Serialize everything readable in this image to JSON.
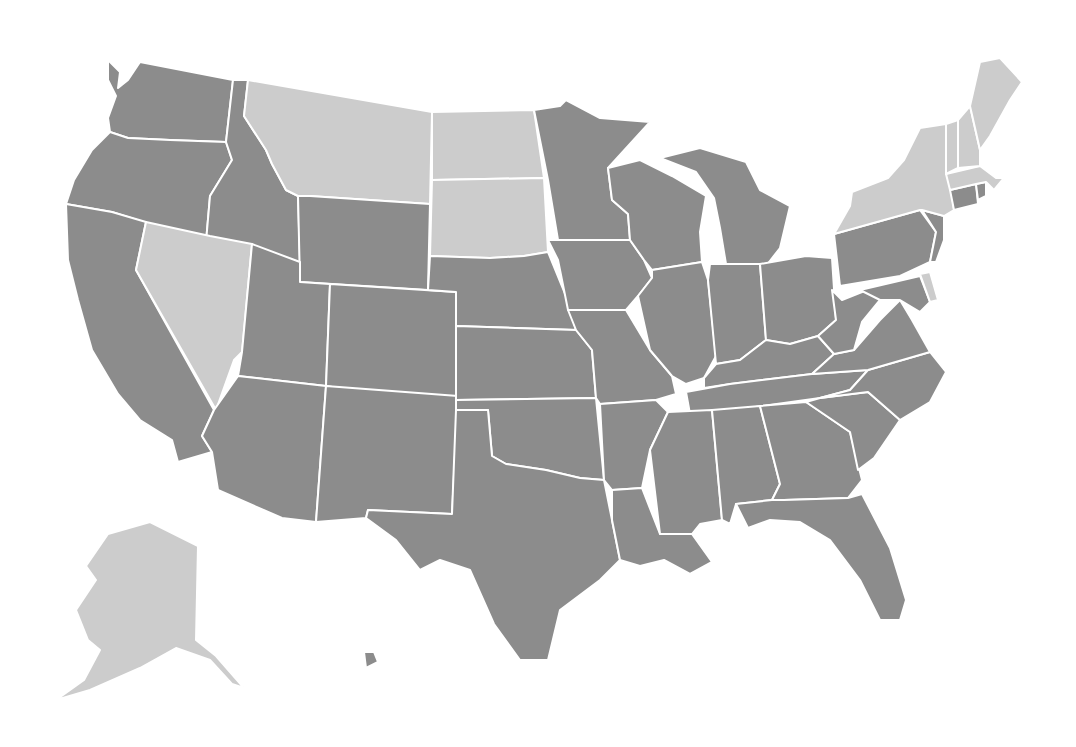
{
  "map": {
    "title": "",
    "type": "choropleth",
    "categories": [
      {
        "id": "dark",
        "color": "#8c8c8c"
      },
      {
        "id": "light",
        "color": "#cccccc"
      }
    ],
    "border_color": "#ffffff",
    "background": "#ffffff",
    "states": [
      {
        "abbr": "WA",
        "category": "dark",
        "points": "108,60 120,72 118,88 128,80 140,62 233,80 226,142 170,140 128,138 110,132 108,118 116,96 108,80"
      },
      {
        "abbr": "OR",
        "category": "dark",
        "points": "110,132 128,138 170,140 226,142 232,160 210,196 206,242 112,212 66,204 74,180 92,150"
      },
      {
        "abbr": "CA",
        "category": "dark",
        "points": "66,204 112,212 146,222 136,270 214,410 202,436 212,452 178,462 172,440 140,420 118,394 92,350 78,300 68,260"
      },
      {
        "abbr": "ID",
        "category": "dark",
        "points": "233,80 248,80 244,116 266,150 272,164 286,190 298,196 300,262 262,260 210,250 206,242 210,196 232,160 226,142"
      },
      {
        "abbr": "NV",
        "category": "light",
        "points": "146,222 210,236 252,244 242,352 234,360 216,410 136,270"
      },
      {
        "abbr": "MT",
        "category": "light",
        "points": "248,80 432,112 430,204 310,196 298,196 286,190 272,164 266,150 244,116"
      },
      {
        "abbr": "WY",
        "category": "dark",
        "points": "310,196 430,204 428,290 300,282 298,196"
      },
      {
        "abbr": "UT",
        "category": "dark",
        "points": "252,244 300,262 300,282 330,284 326,386 238,376 242,352"
      },
      {
        "abbr": "AZ",
        "category": "dark",
        "points": "238,376 326,386 316,522 282,518 218,490 212,452 202,436 214,410"
      },
      {
        "abbr": "CO",
        "category": "dark",
        "points": "330,284 456,292 456,406 326,386"
      },
      {
        "abbr": "NM",
        "category": "dark",
        "points": "326,386 458,396 452,514 368,510 366,518 316,522"
      },
      {
        "abbr": "ND",
        "category": "light",
        "points": "432,112 534,110 544,178 432,180"
      },
      {
        "abbr": "SD",
        "category": "light",
        "points": "432,180 544,178 548,252 524,256 490,258 430,256"
      },
      {
        "abbr": "NE",
        "category": "dark",
        "points": "430,256 490,258 524,256 548,252 566,296 576,330 456,326 456,292 428,290"
      },
      {
        "abbr": "KS",
        "category": "dark",
        "points": "456,326 576,330 592,350 596,398 456,400"
      },
      {
        "abbr": "OK",
        "category": "dark",
        "points": "456,400 596,398 604,480 580,478 546,470 506,464 492,456 488,410 456,410"
      },
      {
        "abbr": "TX",
        "category": "dark",
        "points": "456,410 488,410 492,456 506,464 546,470 580,478 604,480 612,520 620,560 600,580 560,610 548,660 520,660 494,624 470,570 440,560 420,570 396,540 366,518 368,510 452,514"
      },
      {
        "abbr": "MN",
        "category": "dark",
        "points": "534,110 560,106 566,100 600,118 650,122 608,168 612,200 628,214 630,240 558,240 548,180"
      },
      {
        "abbr": "IA",
        "category": "dark",
        "points": "548,240 630,240 644,260 652,278 638,296 626,310 568,310 558,260"
      },
      {
        "abbr": "MO",
        "category": "dark",
        "points": "568,310 626,310 650,350 672,376 676,394 656,400 600,404 596,398 592,350 576,330"
      },
      {
        "abbr": "AR",
        "category": "dark",
        "points": "600,404 656,400 668,412 650,450 642,488 612,490 604,480"
      },
      {
        "abbr": "LA",
        "category": "dark",
        "points": "612,490 642,488 660,534 692,534 712,562 690,574 664,560 640,566 620,560 612,520"
      },
      {
        "abbr": "WI",
        "category": "dark",
        "points": "608,168 640,160 672,176 706,196 700,232 702,262 652,270 644,260 630,240 628,214 612,200"
      },
      {
        "abbr": "IL",
        "category": "dark",
        "points": "652,270 702,262 708,280 716,356 704,378 686,384 672,376 650,350 638,296 652,278"
      },
      {
        "abbr": "MI",
        "category": "dark",
        "points": "660,158 700,148 746,162 760,190 790,206 780,248 766,266 726,264 720,228 714,198 696,172"
      },
      {
        "abbr": "IN",
        "category": "dark",
        "points": "710,264 760,264 766,340 740,360 716,364 708,280"
      },
      {
        "abbr": "OH",
        "category": "dark",
        "points": "760,264 806,256 832,258 836,320 818,336 790,344 766,340"
      },
      {
        "abbr": "KY",
        "category": "dark",
        "points": "716,364 740,360 766,340 790,344 818,336 834,354 812,374 730,384 704,388 704,378"
      },
      {
        "abbr": "TN",
        "category": "dark",
        "points": "686,392 730,384 812,374 868,370 850,390 820,398 720,412 690,414"
      },
      {
        "abbr": "MS",
        "category": "dark",
        "points": "668,412 712,410 722,520 700,524 692,534 660,534 650,450"
      },
      {
        "abbr": "AL",
        "category": "dark",
        "points": "712,410 760,406 780,484 772,500 736,504 730,524 722,520"
      },
      {
        "abbr": "GA",
        "category": "dark",
        "points": "760,406 806,402 850,432 862,480 848,498 784,500 772,500 780,484"
      },
      {
        "abbr": "FL",
        "category": "dark",
        "points": "736,504 772,500 784,500 848,498 862,494 890,548 906,600 900,620 880,620 860,580 830,540 800,522 770,520 748,528"
      },
      {
        "abbr": "SC",
        "category": "dark",
        "points": "820,398 868,392 900,420 874,458 858,470 850,432 806,402"
      },
      {
        "abbr": "NC",
        "category": "dark",
        "points": "868,370 930,352 946,372 930,402 900,420 868,392 820,398 850,390"
      },
      {
        "abbr": "VA",
        "category": "dark",
        "points": "812,374 834,354 854,350 880,320 900,300 912,320 930,352 868,370"
      },
      {
        "abbr": "WV",
        "category": "dark",
        "points": "818,336 836,320 832,290 842,300 872,288 880,300 862,322 854,350 834,354"
      },
      {
        "abbr": "PA",
        "category": "dark",
        "points": "834,234 920,210 936,232 930,262 900,276 840,286"
      },
      {
        "abbr": "MD",
        "category": "dark",
        "points": "860,290 920,276 930,302 920,312 900,300 880,300"
      },
      {
        "abbr": "DE",
        "category": "light",
        "points": "920,274 930,272 938,300 930,302"
      },
      {
        "abbr": "NJ",
        "category": "dark",
        "points": "922,210 944,216 944,240 936,262 930,262 936,232"
      },
      {
        "abbr": "NY",
        "category": "light",
        "points": "852,192 888,178 904,160 920,128 946,124 950,180 954,210 944,216 922,210 920,210 834,234 850,206"
      },
      {
        "abbr": "CT",
        "category": "dark",
        "points": "950,190 976,184 978,204 954,210"
      },
      {
        "abbr": "RI",
        "category": "dark",
        "points": "976,184 986,182 986,196 978,200"
      },
      {
        "abbr": "MA",
        "category": "light",
        "points": "946,174 980,166 996,178 1004,178 994,190 986,182 976,184 950,190"
      },
      {
        "abbr": "VT",
        "category": "light",
        "points": "946,124 958,120 958,168 946,174"
      },
      {
        "abbr": "NH",
        "category": "light",
        "points": "958,120 970,106 980,150 980,166 958,168"
      },
      {
        "abbr": "ME",
        "category": "light",
        "points": "970,106 980,62 1000,58 1022,82 1010,100 990,136 980,150"
      },
      {
        "abbr": "AK",
        "category": "light",
        "points": "108,534 150,522 198,546 196,640 216,656 244,688 232,684 210,660 176,648 140,668 90,690 56,700 84,680 100,650 88,640 76,610 96,580 86,566"
      },
      {
        "abbr": "HI",
        "category": "dark",
        "points": "364,652 374,652 378,662 366,668"
      }
    ]
  }
}
